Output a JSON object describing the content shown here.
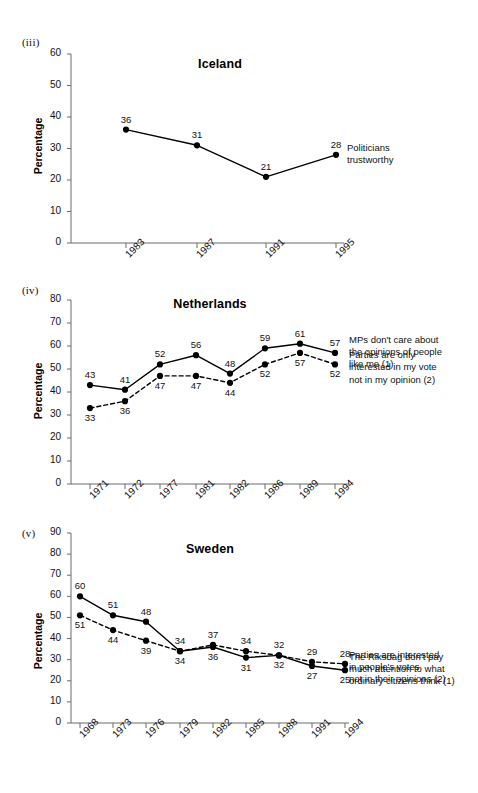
{
  "page": {
    "background": "#ffffff",
    "axis_color": "#6b6b6b",
    "series_color": "#000000"
  },
  "panels": [
    {
      "key": "iceland",
      "numeral": "(iii)",
      "title": "Iceland",
      "ylabel": "Percentage",
      "yticks": [
        "60",
        "50",
        "40",
        "30",
        "20",
        "10",
        "0"
      ],
      "xticks": [
        "1983",
        "1987",
        "1991",
        "1995"
      ],
      "legend": [
        {
          "text": "Politicians\ntrustworthy",
          "anchor_value": 28
        }
      ]
    },
    {
      "key": "netherlands",
      "numeral": "(iv)",
      "title": "Netherlands",
      "ylabel": "Percentage",
      "yticks": [
        "80",
        "70",
        "60",
        "50",
        "40",
        "30",
        "20",
        "10",
        "0"
      ],
      "xticks": [
        "1971",
        "1972",
        "1977",
        "1981",
        "1982",
        "1986",
        "1989",
        "1994"
      ],
      "legend": [
        {
          "text": "MPs don't care about\nthe opinions of people\nlike me (1)",
          "anchor_value": 57
        },
        {
          "text": "Parties are only\ninterested in my vote\nnot in my opinion (2)",
          "anchor_value": 52
        }
      ]
    },
    {
      "key": "sweden",
      "numeral": "(v)",
      "title": "Sweden",
      "ylabel": "Percentage",
      "yticks": [
        "90",
        "80",
        "70",
        "60",
        "50",
        "40",
        "30",
        "20",
        "10",
        "0"
      ],
      "xticks": [
        "1968",
        "1973",
        "1976",
        "1979",
        "1982",
        "1985",
        "1988",
        "1991",
        "1994"
      ],
      "legend": [
        {
          "text": "The Riksdag don't pay\nmuch attention to what\nordinary citizens think (1)",
          "anchor_value": 28
        },
        {
          "text": "Parties are interested\nin people's votes\nnot in their opinions (2)",
          "anchor_value": 25
        }
      ]
    }
  ],
  "chart_data": [
    {
      "type": "line",
      "title": "Iceland",
      "panel": "(iii)",
      "xlabel": "",
      "ylabel": "Percentage",
      "ylim": [
        0,
        60
      ],
      "ytick_step": 10,
      "grid": false,
      "legend_position": "right",
      "categories": [
        "1983",
        "1987",
        "1991",
        "1995"
      ],
      "series": [
        {
          "name": "Politicians trustworthy",
          "style": "solid",
          "marker": "filled-circle",
          "values": [
            36,
            31,
            21,
            28
          ],
          "label_positions": [
            "above",
            "above",
            "above",
            "above"
          ]
        }
      ]
    },
    {
      "type": "line",
      "title": "Netherlands",
      "panel": "(iv)",
      "xlabel": "",
      "ylabel": "Percentage",
      "ylim": [
        0,
        80
      ],
      "ytick_step": 10,
      "grid": false,
      "legend_position": "right",
      "categories": [
        "1971",
        "1972",
        "1977",
        "1981",
        "1982",
        "1986",
        "1989",
        "1994"
      ],
      "series": [
        {
          "name": "MPs don't care about the opinions of people like me (1)",
          "style": "solid",
          "marker": "filled-circle",
          "values": [
            43,
            41,
            52,
            56,
            48,
            59,
            61,
            57
          ],
          "label_positions": [
            "above",
            "above",
            "above",
            "above",
            "above",
            "above",
            "above",
            "above"
          ]
        },
        {
          "name": "Parties are only interested in my vote not in my opinion (2)",
          "style": "dashed",
          "marker": "filled-circle",
          "values": [
            33,
            36,
            47,
            47,
            44,
            52,
            57,
            52
          ],
          "label_positions": [
            "below",
            "below",
            "below",
            "below",
            "below",
            "below",
            "below",
            "below"
          ]
        }
      ]
    },
    {
      "type": "line",
      "title": "Sweden",
      "panel": "(v)",
      "xlabel": "",
      "ylabel": "Percentage",
      "ylim": [
        0,
        90
      ],
      "ytick_step": 10,
      "grid": false,
      "legend_position": "right",
      "categories": [
        "1968",
        "1973",
        "1976",
        "1979",
        "1982",
        "1985",
        "1988",
        "1991",
        "1994"
      ],
      "series": [
        {
          "name": "The Riksdag don't pay much attention to what ordinary citizens think (1)",
          "style": "solid",
          "marker": "filled-circle",
          "values": [
            60,
            51,
            48,
            34,
            36,
            31,
            32,
            27,
            25
          ],
          "label_positions": [
            "above",
            "above",
            "above",
            "below",
            "below",
            "below",
            "below",
            "below",
            "below"
          ]
        },
        {
          "name": "Parties are interested in people's votes not in their opinions (2)",
          "style": "dashed",
          "marker": "filled-circle",
          "values": [
            51,
            44,
            39,
            34,
            37,
            34,
            32,
            29,
            28
          ],
          "label_positions": [
            "below",
            "below",
            "below",
            "above",
            "above",
            "above",
            "above",
            "above",
            "above"
          ]
        }
      ]
    }
  ]
}
